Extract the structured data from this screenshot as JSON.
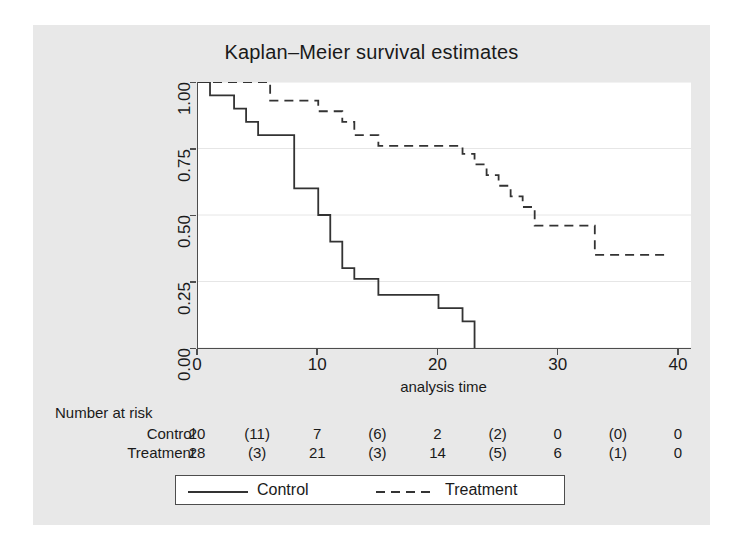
{
  "chart_data": {
    "type": "line",
    "title": "Kaplan–Meier survival estimates",
    "xlabel": "analysis time",
    "ylabel": "",
    "xlim": [
      0,
      41
    ],
    "ylim": [
      0,
      1
    ],
    "grid": true,
    "legend_position": "bottom",
    "xticks": [
      "0",
      "10",
      "20",
      "30",
      "40"
    ],
    "xtick_values": [
      0,
      10,
      20,
      30,
      40
    ],
    "yticks": [
      "0.00",
      "0.25",
      "0.50",
      "0.75",
      "1.00"
    ],
    "ytick_values": [
      0,
      0.25,
      0.5,
      0.75,
      1
    ],
    "series": [
      {
        "name": "Control",
        "style": "solid",
        "color": "#333333",
        "points": [
          [
            0,
            1.0
          ],
          [
            1,
            1.0
          ],
          [
            1,
            0.95
          ],
          [
            3,
            0.95
          ],
          [
            3,
            0.9
          ],
          [
            4,
            0.9
          ],
          [
            4,
            0.85
          ],
          [
            5,
            0.85
          ],
          [
            5,
            0.8
          ],
          [
            8,
            0.8
          ],
          [
            8,
            0.6
          ],
          [
            10,
            0.6
          ],
          [
            10,
            0.5
          ],
          [
            11,
            0.5
          ],
          [
            11,
            0.4
          ],
          [
            12,
            0.4
          ],
          [
            12,
            0.3
          ],
          [
            13,
            0.3
          ],
          [
            13,
            0.26
          ],
          [
            15,
            0.26
          ],
          [
            15,
            0.2
          ],
          [
            20,
            0.2
          ],
          [
            20,
            0.15
          ],
          [
            22,
            0.15
          ],
          [
            22,
            0.1
          ],
          [
            23,
            0.1
          ],
          [
            23,
            0.0
          ]
        ]
      },
      {
        "name": "Treatment",
        "style": "dashed",
        "color": "#333333",
        "points": [
          [
            0,
            1.0
          ],
          [
            6,
            1.0
          ],
          [
            6,
            0.93
          ],
          [
            10,
            0.93
          ],
          [
            10,
            0.89
          ],
          [
            12,
            0.89
          ],
          [
            12,
            0.85
          ],
          [
            13,
            0.85
          ],
          [
            13,
            0.8
          ],
          [
            15,
            0.8
          ],
          [
            15,
            0.76
          ],
          [
            22,
            0.76
          ],
          [
            22,
            0.73
          ],
          [
            23,
            0.73
          ],
          [
            23,
            0.69
          ],
          [
            24,
            0.69
          ],
          [
            24,
            0.65
          ],
          [
            25,
            0.65
          ],
          [
            25,
            0.61
          ],
          [
            26,
            0.61
          ],
          [
            26,
            0.57
          ],
          [
            27,
            0.57
          ],
          [
            27,
            0.53
          ],
          [
            28,
            0.53
          ],
          [
            28,
            0.46
          ],
          [
            33,
            0.46
          ],
          [
            33,
            0.35
          ],
          [
            39,
            0.35
          ]
        ]
      }
    ]
  },
  "risk_table": {
    "title": "Number at risk",
    "time_points": [
      0,
      5,
      10,
      15,
      20,
      25,
      30,
      35,
      40
    ],
    "rows": [
      {
        "label": "Control",
        "values": [
          "20",
          "(11)",
          "7",
          "(6)",
          "2",
          "(2)",
          "0",
          "(0)",
          "0"
        ]
      },
      {
        "label": "Treatment",
        "values": [
          "28",
          "(3)",
          "21",
          "(3)",
          "14",
          "(5)",
          "6",
          "(1)",
          "0"
        ]
      }
    ]
  },
  "legend": {
    "entries": [
      {
        "label": "Control",
        "style": "solid"
      },
      {
        "label": "Treatment",
        "style": "dashed"
      }
    ]
  },
  "colors": {
    "graph_background": "#e8e8e8",
    "plot_background": "#ffffff",
    "axis": "#4d4d4d",
    "grid": "#e6e6e6",
    "text": "#1a1a1a",
    "line": "#333333"
  }
}
